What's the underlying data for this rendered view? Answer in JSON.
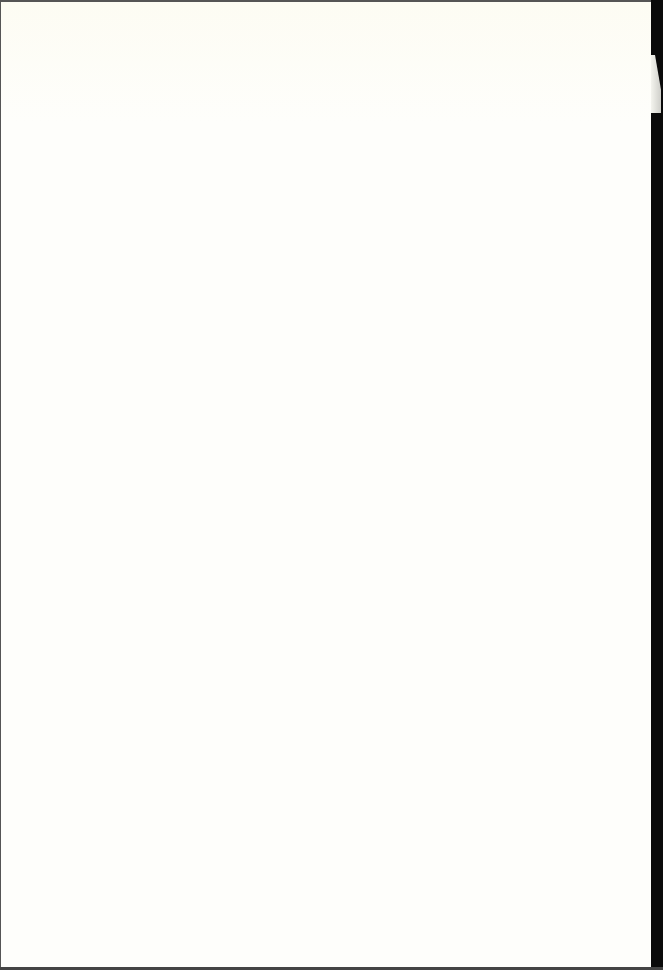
{
  "document": {
    "page_type": "blank scanned page",
    "text": "",
    "colors": {
      "paper": "#fefefb",
      "border": "#1a1a1a"
    }
  }
}
